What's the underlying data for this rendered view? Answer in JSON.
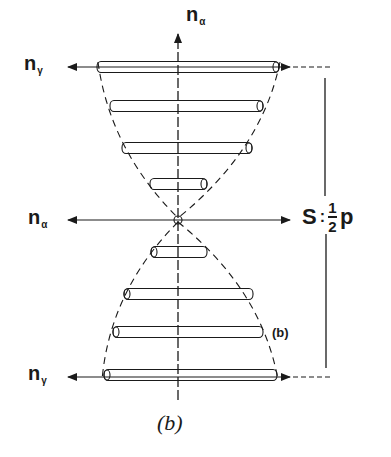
{
  "figure": {
    "caption": "(b)",
    "inner_label": "(b)",
    "labels": {
      "n_alpha_top": {
        "base": "n",
        "sub": "α"
      },
      "n_gamma_top": {
        "base": "n",
        "sub": "γ"
      },
      "n_alpha_left": {
        "base": "n",
        "sub": "α"
      },
      "n_gamma_bottom": {
        "base": "n",
        "sub": "γ"
      }
    },
    "pitch_label": {
      "symbol": "S",
      "equals": ":",
      "numerator": "1",
      "denominator": "2",
      "variable": "p"
    },
    "colors": {
      "ink": "#1a1a1a",
      "background": "#ffffff"
    },
    "rods": [
      {
        "y": 67,
        "x1": 97,
        "x2": 279
      },
      {
        "y": 106,
        "x1": 110,
        "x2": 263
      },
      {
        "y": 148,
        "x1": 122,
        "x2": 252
      },
      {
        "y": 184,
        "x1": 150,
        "x2": 207
      },
      {
        "y": 252,
        "x1": 151,
        "x2": 207
      },
      {
        "y": 294,
        "x1": 124,
        "x2": 253
      },
      {
        "y": 332,
        "x1": 113,
        "x2": 263
      },
      {
        "y": 375,
        "x1": 104,
        "x2": 277
      }
    ]
  }
}
